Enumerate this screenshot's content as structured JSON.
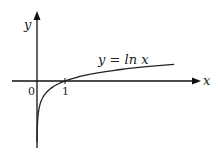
{
  "chart_data": {
    "type": "line",
    "title": "",
    "xlabel": "x",
    "ylabel": "y",
    "series": [
      {
        "name": "y = ln x",
        "function": "ln(x)",
        "x_range": [
          0.003,
          4.9
        ]
      }
    ],
    "tick_labels": {
      "origin": "0",
      "x": [
        "1"
      ]
    },
    "annotations": [
      {
        "text": "y = ln x",
        "position": "above curve, right side"
      }
    ],
    "grid": false,
    "legend": "none"
  },
  "labels": {
    "x_axis": "x",
    "y_axis": "y",
    "origin": "0",
    "tick_one": "1",
    "curve": "y = ln x"
  },
  "colors": {
    "axis": "#111111",
    "curve": "#222222"
  }
}
